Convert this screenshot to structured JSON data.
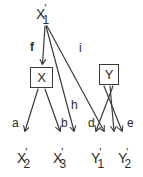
{
  "diagram": {
    "stroke_color": "#3a3a3a",
    "text_color": "#2b2b2b",
    "background": "#ffffff",
    "root_node": {
      "base": "X",
      "prime": "'",
      "sub": "1",
      "text": "X'1"
    },
    "boxes": [
      {
        "label": "X",
        "name": "box-node-x"
      },
      {
        "label": "Y",
        "name": "box-node-y"
      }
    ],
    "leaf_nodes": [
      {
        "base": "X",
        "prime": "'",
        "sub": "2",
        "text": "X'2"
      },
      {
        "base": "X",
        "prime": "'",
        "sub": "3",
        "text": "X'3"
      },
      {
        "base": "Y",
        "prime": "'",
        "sub": "1",
        "text": "Y'1"
      },
      {
        "base": "Y",
        "prime": "'",
        "sub": "2",
        "text": "Y'2"
      }
    ],
    "edge_labels": {
      "f": "f",
      "i": "i",
      "h": "h",
      "a": "a",
      "b": "b",
      "d": "d",
      "e": "e"
    }
  }
}
